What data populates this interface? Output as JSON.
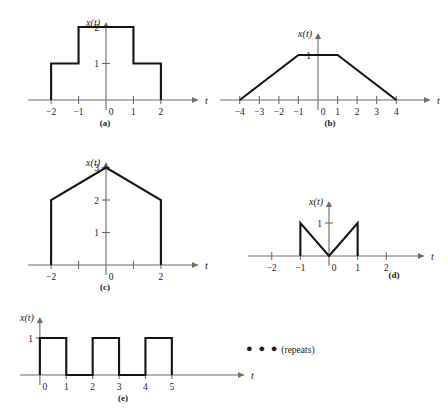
{
  "figure": {
    "background_color": "#ffffff",
    "axis_color": "#6b6b6b",
    "signal_color": "#141414"
  },
  "axis_names": {
    "vertical": "x(t)",
    "horizontal": "t"
  },
  "annotations": {
    "repeats_dots": "● ● ●",
    "repeats_text": "(repeats)"
  },
  "panels": [
    {
      "id": "a",
      "caption": "(a)",
      "x_ticks": [
        -2,
        -1,
        0,
        1,
        2
      ],
      "x_tick_labels": [
        "−2",
        "−1",
        "0",
        "1",
        "2"
      ],
      "y_ticks": [
        1,
        2
      ],
      "y_tick_labels": [
        "1",
        "2"
      ],
      "xlim": [
        -2.55,
        2.55
      ],
      "ylim": [
        0,
        2.35
      ],
      "description": "Staircase pulse: 1 on [-2,-1], 2 on [-1,1], 1 on [1,2]",
      "points": [
        [
          -2,
          0
        ],
        [
          -2,
          1
        ],
        [
          -1,
          1
        ],
        [
          -1,
          2
        ],
        [
          1,
          2
        ],
        [
          1,
          1
        ],
        [
          2,
          1
        ],
        [
          2,
          0
        ]
      ]
    },
    {
      "id": "b",
      "caption": "(b)",
      "x_ticks": [
        -4,
        -3,
        -2,
        -1,
        0,
        1,
        2,
        3,
        4
      ],
      "x_tick_labels": [
        "−4",
        "−3",
        "−2",
        "−1",
        "0",
        "1",
        "2",
        "3",
        "4"
      ],
      "y_ticks": [
        1
      ],
      "y_tick_labels": [
        "1"
      ],
      "xlim": [
        -4.6,
        4.6
      ],
      "ylim": [
        0,
        1.55
      ],
      "description": "Trapezoid: rises 0 to 1 over [-4,-1], flat 1 on [-1,1], falls to 0 over [1,4]",
      "points": [
        [
          -4,
          0
        ],
        [
          -1,
          1
        ],
        [
          1,
          1
        ],
        [
          4,
          0
        ]
      ]
    },
    {
      "id": "c",
      "caption": "(c)",
      "x_ticks": [
        -2,
        -1,
        0,
        1,
        2
      ],
      "x_tick_labels": [
        "−2",
        "",
        "0",
        "",
        "2"
      ],
      "y_ticks": [
        1,
        2,
        3
      ],
      "y_tick_labels": [
        "1",
        "2",
        "3"
      ],
      "xlim": [
        -2.55,
        2.55
      ],
      "ylim": [
        0,
        3.35
      ],
      "description": "House shape: jumps to 2 at t=-2, ramps to peak 3 at t=0, ramps to 2 at t=2, drops to 0",
      "points": [
        [
          -2,
          0
        ],
        [
          -2,
          2
        ],
        [
          0,
          3
        ],
        [
          2,
          2
        ],
        [
          2,
          0
        ]
      ]
    },
    {
      "id": "d",
      "caption": "(d)",
      "x_ticks": [
        -2,
        -1,
        0,
        1,
        2
      ],
      "x_tick_labels": [
        "−2",
        "−1",
        "0",
        "1",
        "2"
      ],
      "y_ticks": [
        1
      ],
      "y_tick_labels": [
        "1"
      ],
      "xlim": [
        -2.55,
        2.55
      ],
      "ylim": [
        0,
        1.5
      ],
      "description": "V shape: jumps to 1 at t=-1, ramps down to 0 at t=0, ramps up to 1 at t=1, drops to 0",
      "points": [
        [
          -1,
          0
        ],
        [
          -1,
          1
        ],
        [
          0,
          0
        ],
        [
          1,
          1
        ],
        [
          1,
          0
        ]
      ]
    },
    {
      "id": "e",
      "caption": "(e)",
      "x_ticks": [
        0,
        1,
        2,
        3,
        4,
        5
      ],
      "x_tick_labels": [
        "0",
        "1",
        "2",
        "3",
        "4",
        "5"
      ],
      "y_ticks": [
        1
      ],
      "y_tick_labels": [
        "1"
      ],
      "xlim": [
        -0.45,
        6.9
      ],
      "ylim": [
        0,
        1.5
      ],
      "description": "Periodic square wave, period 2, unit pulses on [0,1], [2,3], [4,5], repeating",
      "points": [
        [
          0,
          0
        ],
        [
          0,
          1
        ],
        [
          1,
          1
        ],
        [
          1,
          0
        ],
        [
          2,
          0
        ],
        [
          2,
          1
        ],
        [
          3,
          1
        ],
        [
          3,
          0
        ],
        [
          4,
          0
        ],
        [
          4,
          1
        ],
        [
          5,
          1
        ],
        [
          5,
          0
        ]
      ]
    }
  ]
}
